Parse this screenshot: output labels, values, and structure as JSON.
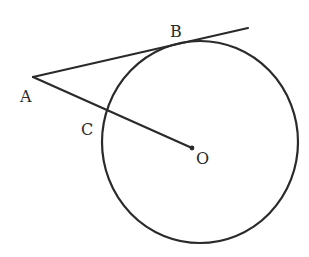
{
  "diagram": {
    "type": "geometry",
    "stroke_color": "#2a2a2a",
    "circle": {
      "center_label": "O",
      "cx": 200,
      "cy": 142,
      "rx": 98,
      "ry": 101
    },
    "points": {
      "A": {
        "label": "A",
        "x": 33,
        "y": 77,
        "label_x": 20,
        "label_y": 102
      },
      "B": {
        "label": "B",
        "x": 197,
        "y": 40,
        "label_x": 170,
        "label_y": 37
      },
      "C": {
        "label": "C",
        "x": 107,
        "y": 111,
        "label_x": 81,
        "label_y": 135
      },
      "O": {
        "label": "O",
        "x": 192,
        "y": 148,
        "label_x": 196,
        "label_y": 164
      }
    },
    "segments": [
      {
        "name": "tangent-AB",
        "from": "A",
        "to_x": 248,
        "to_y": 28
      },
      {
        "name": "secant-AO",
        "from": "A",
        "to": "O"
      }
    ]
  }
}
